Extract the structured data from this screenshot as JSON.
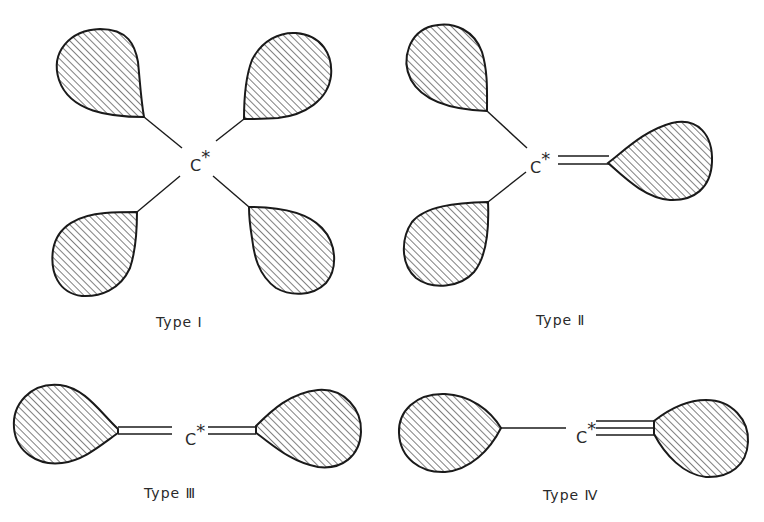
{
  "figure": {
    "atom_label": "C",
    "atom_marker": "*",
    "hatch_color": "#1a1a1a",
    "panels": [
      {
        "id": "type-1",
        "caption": "Type Ⅰ",
        "bonds": [
          "single",
          "single",
          "single",
          "single"
        ],
        "lobe_count": 4
      },
      {
        "id": "type-2",
        "caption": "Type Ⅱ",
        "bonds": [
          "single",
          "single",
          "double"
        ],
        "lobe_count": 3
      },
      {
        "id": "type-3",
        "caption": "Type Ⅲ",
        "bonds": [
          "double",
          "double"
        ],
        "lobe_count": 2
      },
      {
        "id": "type-4",
        "caption": "Type Ⅳ",
        "bonds": [
          "single",
          "triple"
        ],
        "lobe_count": 2
      }
    ]
  }
}
